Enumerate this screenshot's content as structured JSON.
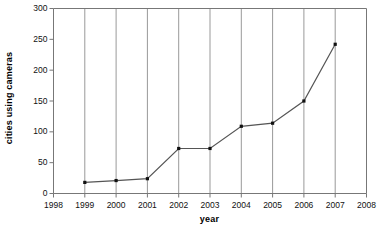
{
  "chart_data": {
    "type": "line",
    "title": "",
    "xlabel": "year",
    "ylabel": "cities using cameras",
    "x": [
      1999,
      2000,
      2001,
      2002,
      2003,
      2004,
      2005,
      2006,
      2007
    ],
    "values": [
      18,
      21,
      24,
      73,
      73,
      109,
      114,
      150,
      242
    ],
    "series": [
      {
        "name": "cities using cameras",
        "values": [
          18,
          21,
          24,
          73,
          73,
          109,
          114,
          150,
          242
        ]
      }
    ],
    "xlim": [
      1998,
      2008
    ],
    "ylim": [
      0,
      300
    ],
    "xticks": [
      1998,
      1999,
      2000,
      2001,
      2002,
      2003,
      2004,
      2005,
      2006,
      2007,
      2008
    ],
    "xtick_labels": [
      "1998",
      "1999",
      "2000",
      "2001",
      "2002",
      "2003",
      "2004",
      "2005",
      "2006",
      "2007",
      "2008"
    ],
    "yticks": [
      0,
      50,
      100,
      150,
      200,
      250,
      300
    ],
    "ytick_labels": [
      "0",
      "50",
      "100",
      "150",
      "200",
      "250",
      "300"
    ],
    "grid": "vertical",
    "legend": "none",
    "marker": "square",
    "line_color": "#555555",
    "marker_color": "#111111",
    "grid_color": "#999999",
    "axis_color": "#777777",
    "background_color": "#ffffff"
  }
}
